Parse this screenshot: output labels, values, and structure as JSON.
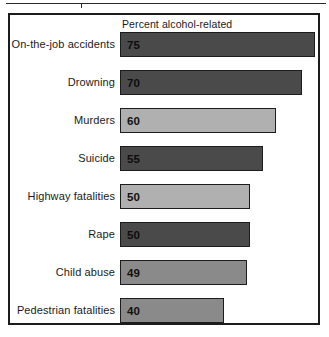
{
  "chart_data": {
    "type": "bar",
    "orientation": "horizontal",
    "title": "",
    "header_label": "Percent alcohol-related",
    "xlabel": "",
    "ylabel": "",
    "xlim": [
      0,
      75
    ],
    "grid": false,
    "legend": "none",
    "value_labels_inside_bars": true,
    "categories": [
      "On-the-job accidents",
      "Drowning",
      "Murders",
      "Suicide",
      "Highway fatalities",
      "Rape",
      "Child abuse",
      "Pedestrian fatalities"
    ],
    "values": [
      75,
      70,
      60,
      55,
      50,
      50,
      49,
      40
    ],
    "bars": [
      {
        "label": "On-the-job accidents",
        "value": 75,
        "value_text": "75",
        "fill": "#4a4a4a"
      },
      {
        "label": "Drowning",
        "value": 70,
        "value_text": "70",
        "fill": "#4a4a4a"
      },
      {
        "label": "Murders",
        "value": 60,
        "value_text": "60",
        "fill": "#b0b0b0"
      },
      {
        "label": "Suicide",
        "value": 55,
        "value_text": "55",
        "fill": "#4a4a4a"
      },
      {
        "label": "Highway fatalities",
        "value": 50,
        "value_text": "50",
        "fill": "#b0b0b0"
      },
      {
        "label": "Rape",
        "value": 50,
        "value_text": "50",
        "fill": "#4a4a4a"
      },
      {
        "label": "Child abuse",
        "value": 49,
        "value_text": "49",
        "fill": "#8a8a8a"
      },
      {
        "label": "Pedestrian fatalities",
        "value": 40,
        "value_text": "40",
        "fill": "#8a8a8a"
      }
    ],
    "colors": {
      "dark": "#4a4a4a",
      "medium": "#8a8a8a",
      "light": "#b0b0b0",
      "outline": "#1c1c1c",
      "background": "#ffffff"
    },
    "scale": {
      "bar_origin_px": 120,
      "px_per_unit": 2.6
    }
  }
}
